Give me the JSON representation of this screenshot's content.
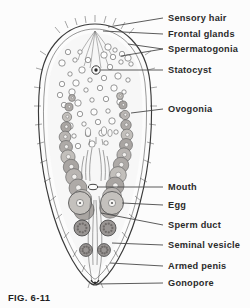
{
  "figure": {
    "caption": "FIG. 6-11",
    "background_color": "#fcfcfc",
    "ink_color": "#3a3a3a",
    "text_color": "#2b2b2b"
  },
  "labels": [
    {
      "id": "sensory-hair",
      "text": "Sensory hair",
      "text_x": 168,
      "text_y": 21,
      "leader_x1": 163,
      "leader_y1": 18,
      "leader_x2": 108,
      "leader_y2": 27
    },
    {
      "id": "frontal-glands",
      "text": "Frontal glands",
      "text_x": 168,
      "text_y": 37,
      "leader_x1": 163,
      "leader_y1": 34,
      "leader_x2": 103,
      "leader_y2": 31
    },
    {
      "id": "spermatogonia",
      "text": "Spermatogonia",
      "text_x": 168,
      "text_y": 52,
      "leader_x1": 163,
      "leader_y1": 49,
      "leader_x2": 121,
      "leader_y2": 56
    },
    {
      "id": "statocyst",
      "text": "Statocyst",
      "text_x": 168,
      "text_y": 73,
      "leader_x1": 163,
      "leader_y1": 70,
      "leader_x2": 101,
      "leader_y2": 70
    },
    {
      "id": "ovogonia",
      "text": "Ovogonia",
      "text_x": 168,
      "text_y": 112,
      "leader_x1": 163,
      "leader_y1": 109,
      "leader_x2": 131,
      "leader_y2": 113
    },
    {
      "id": "mouth",
      "text": "Mouth",
      "text_x": 168,
      "text_y": 190,
      "leader_x1": 163,
      "leader_y1": 187,
      "leader_x2": 97,
      "leader_y2": 187
    },
    {
      "id": "egg",
      "text": "Egg",
      "text_x": 168,
      "text_y": 208,
      "leader_x1": 163,
      "leader_y1": 205,
      "leader_x2": 122,
      "leader_y2": 203
    },
    {
      "id": "sperm-duct",
      "text": "Sperm duct",
      "text_x": 168,
      "text_y": 228,
      "leader_x1": 163,
      "leader_y1": 225,
      "leader_x2": 101,
      "leader_y2": 213
    },
    {
      "id": "seminal-vesicle",
      "text": "Seminal vesicle",
      "text_x": 168,
      "text_y": 248,
      "leader_x1": 163,
      "leader_y1": 245,
      "leader_x2": 112,
      "leader_y2": 243
    },
    {
      "id": "armed-penis",
      "text": "Armed penis",
      "text_x": 168,
      "text_y": 269,
      "leader_x1": 163,
      "leader_y1": 266,
      "leader_x2": 110,
      "leader_y2": 263
    },
    {
      "id": "gonopore",
      "text": "Gonopore",
      "text_x": 168,
      "text_y": 286,
      "leader_x1": 163,
      "leader_y1": 283,
      "leader_x2": 96,
      "leader_y2": 284
    }
  ],
  "anatomy": {
    "body_outline": "organism body wall, ovoid tapering to posterior point",
    "statocyst": {
      "cx": 96,
      "cy": 70,
      "r": 4.2,
      "inner_r": 1.7
    },
    "mouth": {
      "cx": 93,
      "cy": 187,
      "rx": 4.5,
      "ry": 2.6
    },
    "ovogonia_left": [
      [
        72,
        98
      ],
      [
        69,
        107
      ],
      [
        67,
        117
      ],
      [
        66,
        127
      ],
      [
        65,
        137
      ],
      [
        66,
        147
      ],
      [
        68,
        157
      ],
      [
        71,
        167
      ],
      [
        74,
        177
      ],
      [
        78,
        188
      ],
      [
        82,
        199
      ],
      [
        84,
        210
      ]
    ],
    "ovogonia_right": [
      [
        120,
        96
      ],
      [
        123,
        105
      ],
      [
        125,
        115
      ],
      [
        126,
        125
      ],
      [
        127,
        135
      ],
      [
        126,
        145
      ],
      [
        124,
        155
      ],
      [
        121,
        165
      ],
      [
        118,
        175
      ],
      [
        115,
        186
      ],
      [
        112,
        197
      ],
      [
        110,
        208
      ]
    ],
    "spermatogonia": [
      [
        115,
        50
      ],
      [
        122,
        54
      ],
      [
        128,
        58
      ],
      [
        121,
        62
      ],
      [
        113,
        57
      ],
      [
        108,
        47
      ],
      [
        75,
        60
      ],
      [
        68,
        52
      ],
      [
        62,
        63
      ],
      [
        80,
        52
      ],
      [
        88,
        60
      ],
      [
        104,
        55
      ],
      [
        131,
        64
      ],
      [
        110,
        67
      ],
      [
        82,
        70
      ],
      [
        70,
        74
      ],
      [
        62,
        84
      ],
      [
        76,
        83
      ],
      [
        90,
        80
      ],
      [
        104,
        78
      ],
      [
        118,
        76
      ],
      [
        128,
        80
      ],
      [
        60,
        95
      ],
      [
        72,
        92
      ],
      [
        86,
        90
      ],
      [
        100,
        88
      ],
      [
        114,
        88
      ],
      [
        124,
        92
      ],
      [
        64,
        105
      ],
      [
        78,
        103
      ],
      [
        92,
        100
      ],
      [
        106,
        99
      ],
      [
        120,
        102
      ],
      [
        66,
        116
      ],
      [
        80,
        114
      ],
      [
        94,
        112
      ],
      [
        108,
        111
      ],
      [
        122,
        115
      ],
      [
        70,
        126
      ],
      [
        84,
        124
      ],
      [
        98,
        122
      ],
      [
        112,
        121
      ],
      [
        74,
        136
      ],
      [
        88,
        134
      ],
      [
        102,
        133
      ],
      [
        116,
        132
      ],
      [
        78,
        146
      ],
      [
        92,
        144
      ],
      [
        106,
        143
      ]
    ],
    "seminal_vesicles": [
      [
        82,
        228
      ],
      [
        108,
        228
      ]
    ],
    "penis_bulbs": [
      [
        86,
        250
      ],
      [
        104,
        250
      ]
    ],
    "eggs": [
      [
        80,
        203
      ],
      [
        112,
        203
      ]
    ]
  }
}
